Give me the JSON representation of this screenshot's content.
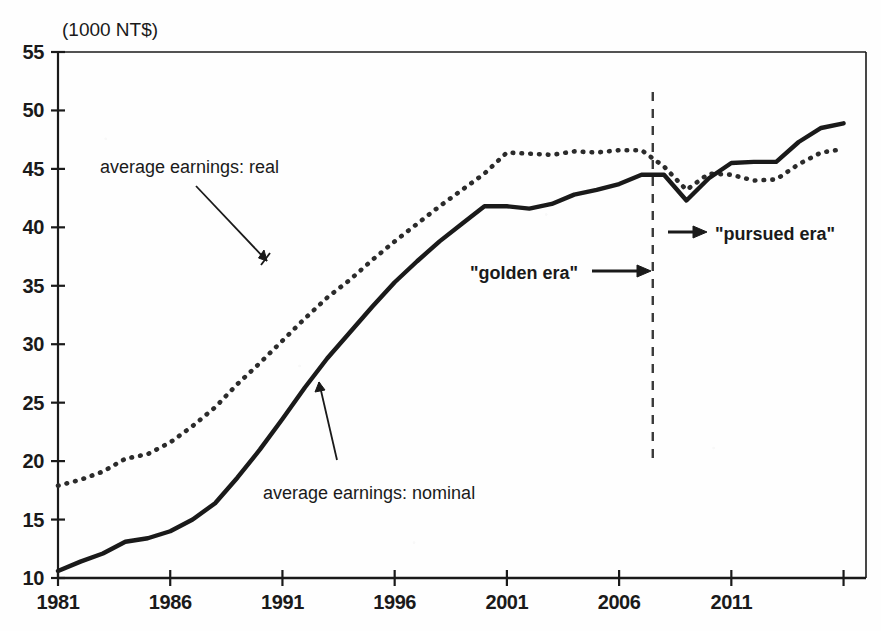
{
  "chart_data": {
    "type": "line",
    "title": "",
    "subtitle": "",
    "unit_label": "(1000 NT$)",
    "xlabel": "",
    "ylabel": "",
    "xlim": [
      1981,
      2017
    ],
    "ylim": [
      10,
      55
    ],
    "ytick_values": [
      10,
      15,
      20,
      25,
      30,
      35,
      40,
      45,
      50,
      55
    ],
    "ytick_labels": [
      "10",
      "15",
      "20",
      "25",
      "30",
      "35",
      "40",
      "45",
      "50",
      "55"
    ],
    "xtick_values": [
      1981,
      1986,
      1991,
      1996,
      2001,
      2006,
      2011,
      2016
    ],
    "xtick_labels": [
      "1981",
      "1986",
      "1991",
      "1996",
      "2001",
      "2006",
      "2011",
      ""
    ],
    "grid": false,
    "legend_position": "inline-annotations",
    "x": [
      1981,
      1982,
      1983,
      1984,
      1985,
      1986,
      1987,
      1988,
      1989,
      1990,
      1991,
      1992,
      1993,
      1994,
      1995,
      1996,
      1997,
      1998,
      1999,
      2000,
      2001,
      2002,
      2003,
      2004,
      2005,
      2006,
      2007,
      2008,
      2009,
      2010,
      2011,
      2012,
      2013,
      2014,
      2015,
      2016
    ],
    "series": [
      {
        "name": "average earnings: nominal",
        "style": "solid",
        "color": "#1a1a1a",
        "values": [
          10.6,
          11.4,
          12.1,
          13.1,
          13.4,
          14.0,
          15.0,
          16.4,
          18.6,
          21.0,
          23.6,
          26.3,
          28.8,
          31.0,
          33.2,
          35.3,
          37.1,
          38.8,
          40.3,
          41.8,
          41.8,
          41.6,
          42.0,
          42.8,
          43.2,
          43.7,
          44.5,
          44.5,
          42.3,
          44.2,
          45.5,
          45.6,
          45.6,
          47.3,
          48.5,
          48.9
        ]
      },
      {
        "name": "average earnings: real",
        "style": "dotted",
        "color": "#2b2b2b",
        "values": [
          17.9,
          18.4,
          19.1,
          20.2,
          20.6,
          21.6,
          23.0,
          24.6,
          26.6,
          28.4,
          30.3,
          32.2,
          34.0,
          35.5,
          37.2,
          38.8,
          40.3,
          41.8,
          43.2,
          44.6,
          46.4,
          46.3,
          46.2,
          46.5,
          46.4,
          46.6,
          46.6,
          45.2,
          43.2,
          44.6,
          44.5,
          44.0,
          44.1,
          45.4,
          46.4,
          46.7
        ]
      }
    ],
    "annotations": [
      {
        "id": "label-real",
        "text": "average earnings: real",
        "kind": "series-label"
      },
      {
        "id": "label-nominal",
        "text": "average earnings: nominal",
        "kind": "series-label"
      },
      {
        "id": "label-golden",
        "text": "\"golden era\"",
        "kind": "era-label"
      },
      {
        "id": "label-pursued",
        "text": "\"pursued era\"",
        "kind": "era-label"
      }
    ],
    "divider": {
      "x_value": 2007.5,
      "style": "dashed",
      "color": "#3a3a3a"
    }
  }
}
